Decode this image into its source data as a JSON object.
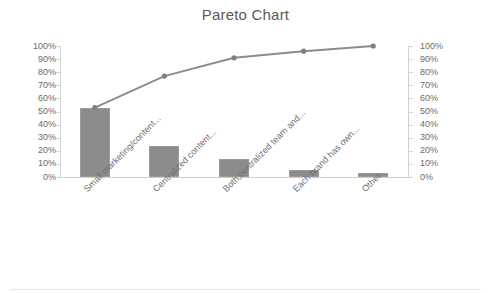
{
  "chart_data": {
    "type": "bar",
    "title": "Pareto Chart",
    "xlabel": "",
    "ylabel": "",
    "ylim": [
      0,
      100
    ],
    "grid": false,
    "legend": false,
    "categories": [
      "Small marketing/content...",
      "Centralized content...",
      "Both;centralized team and...",
      "Each brand has own...",
      "Other"
    ],
    "series": [
      {
        "name": "Frequency",
        "type": "bar",
        "axis": "left",
        "values": [
          53,
          24,
          14,
          5,
          3
        ]
      },
      {
        "name": "Cumulative %",
        "type": "line",
        "axis": "right",
        "values": [
          53,
          77,
          91,
          96,
          100
        ]
      }
    ],
    "y_ticks": [
      "0%",
      "10%",
      "20%",
      "30%",
      "40%",
      "50%",
      "60%",
      "70%",
      "80%",
      "90%",
      "100%"
    ],
    "y_ticks_right": [
      "0%",
      "10%",
      "20%",
      "30%",
      "40%",
      "50%",
      "60%",
      "70%",
      "80%",
      "90%",
      "100%"
    ]
  },
  "colors": {
    "bar": "#8c8c8c",
    "line": "#8c8c8c",
    "marker": "#7f7f7f",
    "axis": "#d0d0d0",
    "text": "#6b6b6b",
    "title": "#5a5a5a"
  }
}
